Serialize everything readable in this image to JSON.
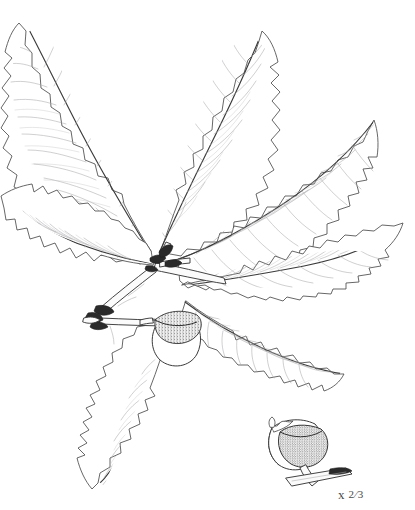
{
  "plate": {
    "title": "Oak branch with leaves and acorns",
    "subject": "quercus-branch",
    "background_color": "#ffffff",
    "ink_color": "#4b4b4b",
    "vein_color": "#a8a8ad",
    "width": 415,
    "height": 510
  },
  "annotation": {
    "scale_label": "x",
    "scale_fraction": "2⁄3",
    "full_text": "x 2/3"
  },
  "specimen": {
    "branch_label": "branch-with-terminal-cluster",
    "leaf_count": 7,
    "acorn_count": 2,
    "leaves": [
      {
        "id": "leaf-upper-left",
        "position": "upper-left"
      },
      {
        "id": "leaf-upper-center",
        "position": "upper-center"
      },
      {
        "id": "leaf-upper-right",
        "position": "upper-right"
      },
      {
        "id": "leaf-mid-left",
        "position": "middle-left"
      },
      {
        "id": "leaf-mid-right",
        "position": "middle-right"
      },
      {
        "id": "leaf-lower-right",
        "position": "lower-right"
      },
      {
        "id": "leaf-lower-left",
        "position": "lower-left"
      }
    ],
    "acorns": [
      {
        "id": "acorn-on-branch",
        "position": "center",
        "has_cup": true
      },
      {
        "id": "acorn-detail",
        "position": "bottom-right",
        "has_cup": true,
        "detached": true
      }
    ],
    "bud_cluster": {
      "id": "terminal-buds",
      "position": "center-left"
    }
  }
}
